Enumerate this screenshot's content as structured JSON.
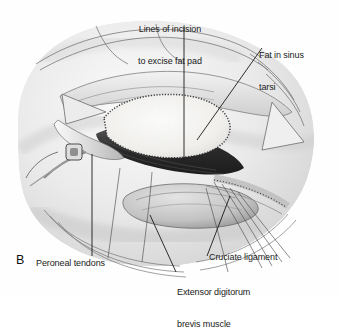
{
  "figure": {
    "panel_letter": "B",
    "type": "medical-illustration",
    "style": "grayscale airbrush and pencil surgical illustration",
    "background_color": "#ffffff",
    "ink_color": "#1a1a1a"
  },
  "labels": {
    "incision_line1": "Lines of incision",
    "incision_line2": "to excise fat pad",
    "fat_line1": "Fat in sinus",
    "fat_line2": "tarsi",
    "peroneal": "Peroneal tendons",
    "cruciate": "Cruciate ligament",
    "edb_line1": "Extensor digitorum",
    "edb_line2": "brevis muscle"
  },
  "leaders": [
    {
      "name": "incision-leader",
      "from": [
        184,
        26
      ],
      "to": [
        184,
        160
      ]
    },
    {
      "name": "fat-leader",
      "from": [
        262,
        48
      ],
      "to": [
        197,
        140
      ]
    },
    {
      "name": "peroneal-leader",
      "from": [
        92,
        256
      ],
      "to": [
        92,
        154
      ]
    },
    {
      "name": "cruciate-leader",
      "from": [
        207,
        256
      ],
      "to": [
        230,
        196
      ]
    },
    {
      "name": "edb-leader",
      "from": [
        176,
        272
      ],
      "to": [
        150,
        215
      ]
    }
  ],
  "anatomy": {
    "skin_tone": "#e6e6e6",
    "fat_pad_tone": "#f4f4f2",
    "muscle_shadow_tone": "#2e2e2e",
    "tendon_tone": "#d8d8d8",
    "regions": [
      {
        "name": "sinus-tarsi-fat-pad",
        "tone": "#f4f4f2"
      },
      {
        "name": "deep-wound-shadow",
        "tone": "#262626"
      },
      {
        "name": "peroneal-tendon-bundle",
        "tone": "#dcdcdc"
      },
      {
        "name": "extensor-digitorum-brevis-muscle",
        "tone": "#c4c4c4"
      },
      {
        "name": "cruciate-ligament",
        "tone": "#cfcfcf"
      },
      {
        "name": "retracted-skin-flap",
        "tone": "#e9e9e9"
      }
    ]
  }
}
